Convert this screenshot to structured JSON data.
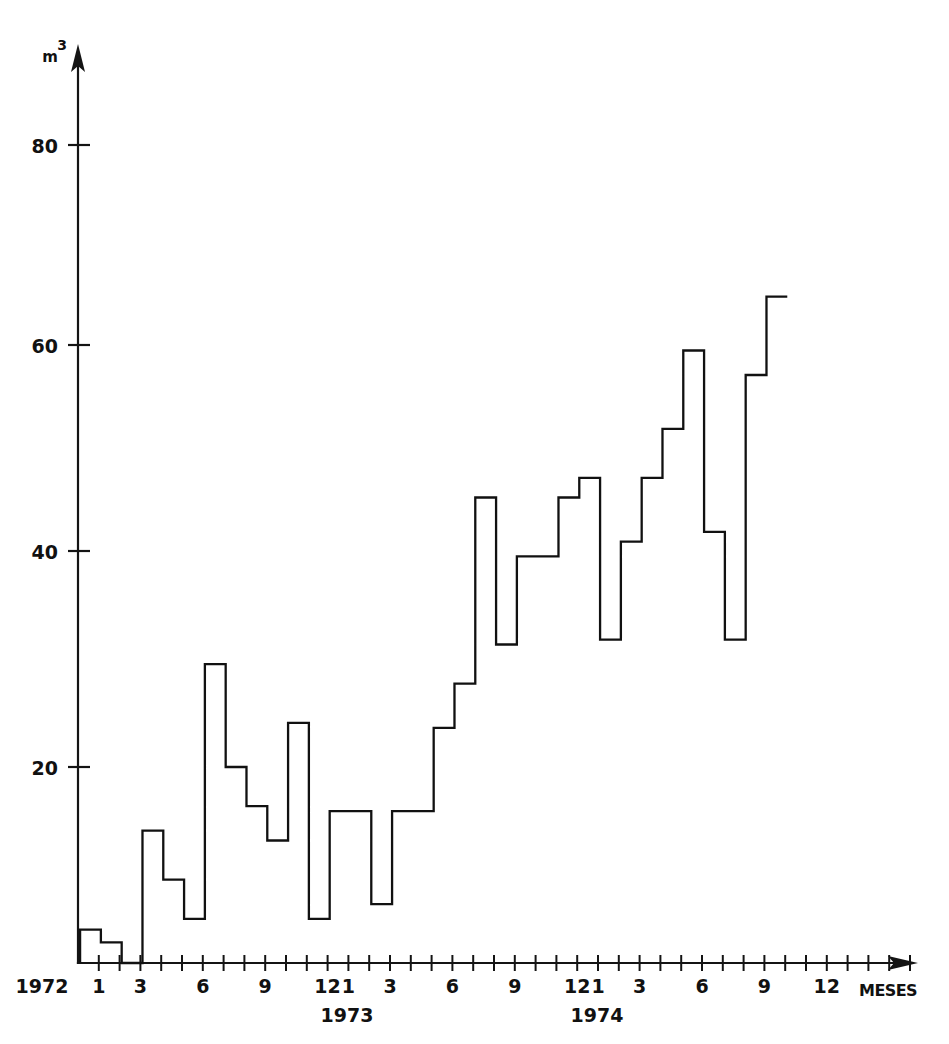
{
  "figure": {
    "background_color": "#ffffff",
    "line_color": "#111111",
    "style": "hand-drawn scanned technical figure"
  },
  "axes": {
    "y_unit_base": "m",
    "y_unit_exponent": "3",
    "x_axis_name": "MESES",
    "y_ticks": [
      "20",
      "40",
      "60",
      "80"
    ],
    "year_labels": [
      "1972",
      "1973",
      "1974"
    ],
    "x_tick_labels_1972": [
      "1",
      "3",
      "6",
      "9",
      "12"
    ],
    "x_tick_labels_1973": [
      "1",
      "3",
      "6",
      "9",
      "12"
    ],
    "x_tick_labels_1974": [
      "1",
      "3",
      "6",
      "9",
      "12"
    ]
  },
  "chart_data": {
    "type": "line",
    "drawing_style": "step-post",
    "title": "",
    "subtitle": "",
    "xlabel": "MESES",
    "ylabel": "m3",
    "xlim": [
      0,
      41
    ],
    "ylim": [
      0,
      90
    ],
    "grid": false,
    "legend": null,
    "x_tick_interval_months": 1,
    "x_labeled_ticks": [
      {
        "index": 1,
        "label": "1",
        "year": "1972"
      },
      {
        "index": 3,
        "label": "3",
        "year": "1972"
      },
      {
        "index": 6,
        "label": "6",
        "year": "1972"
      },
      {
        "index": 9,
        "label": "9",
        "year": "1972"
      },
      {
        "index": 12,
        "label": "12",
        "year": "1972"
      },
      {
        "index": 13,
        "label": "1",
        "year": "1973"
      },
      {
        "index": 15,
        "label": "3",
        "year": "1973"
      },
      {
        "index": 18,
        "label": "6",
        "year": "1973"
      },
      {
        "index": 21,
        "label": "9",
        "year": "1973"
      },
      {
        "index": 24,
        "label": "12",
        "year": "1973"
      },
      {
        "index": 25,
        "label": "1",
        "year": "1974"
      },
      {
        "index": 27,
        "label": "3",
        "year": "1974"
      },
      {
        "index": 30,
        "label": "6",
        "year": "1974"
      },
      {
        "index": 33,
        "label": "9",
        "year": "1974"
      },
      {
        "index": 36,
        "label": "12",
        "year": "1974"
      }
    ],
    "y_ticks": [
      20,
      40,
      60,
      80
    ],
    "categories": [
      "1972-01",
      "1972-02",
      "1972-03",
      "1972-04",
      "1972-05",
      "1972-06",
      "1972-07",
      "1972-08",
      "1972-09",
      "1972-10",
      "1972-11",
      "1972-12",
      "1973-01",
      "1973-02",
      "1973-03",
      "1973-04",
      "1973-05",
      "1973-06",
      "1973-07",
      "1973-08",
      "1973-09",
      "1973-10",
      "1973-11",
      "1973-12",
      "1974-01",
      "1974-02",
      "1974-03",
      "1974-04",
      "1974-05",
      "1974-06",
      "1974-07",
      "1974-08",
      "1974-09",
      "1974-10"
    ],
    "values": [
      3.4,
      2.1,
      0,
      13.5,
      8.5,
      4.5,
      30.5,
      20,
      16,
      12.5,
      24.5,
      4.5,
      15.5,
      15.5,
      6,
      15.5,
      15.5,
      24,
      28.5,
      47.5,
      32.5,
      41.5,
      41.5,
      47.5,
      49.5,
      33,
      43,
      49.5,
      54.5,
      62.5,
      44,
      33,
      60,
      68
    ],
    "notable_points": {
      "max_value": 68,
      "max_month": "1974-10",
      "min_value": 0,
      "min_month": "1972-03",
      "trend": "increasing"
    }
  }
}
